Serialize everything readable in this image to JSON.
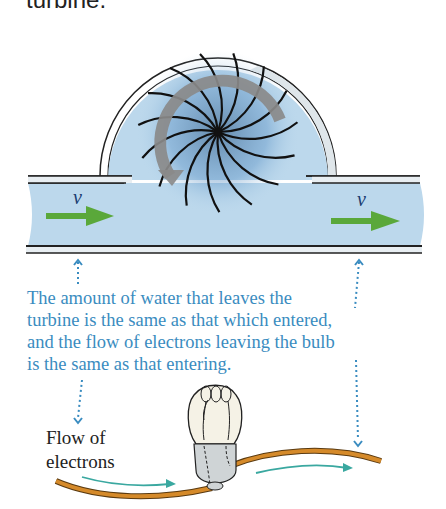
{
  "header": {
    "caption_fragment": "turbine."
  },
  "turbine": {
    "inlet_velocity_label": "v",
    "outlet_velocity_label": "v"
  },
  "explanation": {
    "lines": [
      "The amount of water that leaves the",
      "turbine is the same as that which entered,",
      "and the flow of electrons leaving the bulb",
      "is the same as that entering."
    ]
  },
  "circuit": {
    "label_lines": [
      "Flow of",
      "electrons"
    ]
  },
  "colors": {
    "water": "#bcd8ec",
    "velocity_arrow": "#5aa83a",
    "rotation_arrow": "#8a8a8a",
    "text_blue": "#3a8cc0",
    "wire": "#d58a2a",
    "electron_arrow": "#3aa8a0",
    "dotted_leader": "#3a8cc0"
  }
}
